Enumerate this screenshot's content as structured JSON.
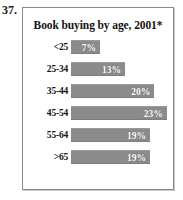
{
  "figure": {
    "number_label": "37."
  },
  "chart_data": {
    "type": "bar",
    "orientation": "horizontal",
    "title": "Book buying by age, 2001*",
    "xlabel": "",
    "ylabel": "",
    "categories": [
      "<25",
      "25-34",
      "35-44",
      "45-54",
      "55-64",
      ">65"
    ],
    "values": [
      7,
      13,
      20,
      23,
      19,
      19
    ],
    "value_labels": [
      "7%",
      "13%",
      "20%",
      "23%",
      "19%",
      "19%"
    ],
    "xlim": [
      0,
      25
    ],
    "grid": false,
    "legend": null,
    "bar_color": "#8b8b8b",
    "value_label_color": "#ffffff",
    "series": [
      {
        "name": "Share of book buyers",
        "values": [
          7,
          13,
          20,
          23,
          19,
          19
        ]
      }
    ]
  }
}
